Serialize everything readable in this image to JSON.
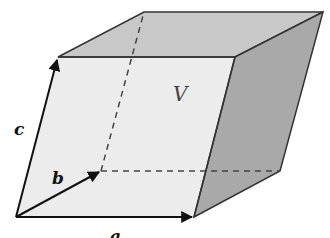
{
  "diagram": {
    "labels": {
      "a": "a",
      "b": "b",
      "c": "c",
      "volume": "V"
    },
    "colors": {
      "front_face": "#ececec",
      "top_face": "#c8c8c8",
      "side_face": "#a9a9a9",
      "edge": "#333333",
      "vector": "#111111",
      "hidden_edge": "#444444"
    }
  }
}
